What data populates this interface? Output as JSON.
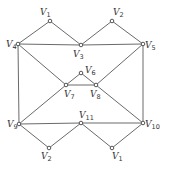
{
  "diagram": {
    "type": "graph",
    "width": 169,
    "height": 171,
    "colors": {
      "edge": "#6a6a6a",
      "node_stroke": "#555555",
      "node_fill": "#ffffff",
      "label": "#333333"
    },
    "nodes": [
      {
        "id": "n_v1_top",
        "letter": "V",
        "sub": "1",
        "x": 50,
        "y": 21,
        "lx": 40,
        "ly": 15
      },
      {
        "id": "n_v2_top",
        "letter": "V",
        "sub": "2",
        "x": 112,
        "y": 21,
        "lx": 113,
        "ly": 15
      },
      {
        "id": "n_v3",
        "letter": "V",
        "sub": "3",
        "x": 81,
        "y": 45,
        "lx": 73,
        "ly": 57
      },
      {
        "id": "n_v4",
        "letter": "V",
        "sub": "4",
        "x": 18,
        "y": 44,
        "lx": 6,
        "ly": 47
      },
      {
        "id": "n_v5",
        "letter": "V",
        "sub": "5",
        "x": 143,
        "y": 44,
        "lx": 145,
        "ly": 48
      },
      {
        "id": "n_v6",
        "letter": "V",
        "sub": "6",
        "x": 81,
        "y": 73,
        "lx": 85,
        "ly": 73
      },
      {
        "id": "n_v7",
        "letter": "V",
        "sub": "7",
        "x": 66,
        "y": 85,
        "lx": 64,
        "ly": 97
      },
      {
        "id": "n_v8",
        "letter": "V",
        "sub": "8",
        "x": 96,
        "y": 85,
        "lx": 90,
        "ly": 97
      },
      {
        "id": "n_v9",
        "letter": "V",
        "sub": "9",
        "x": 19,
        "y": 124,
        "lx": 7,
        "ly": 127
      },
      {
        "id": "n_v10",
        "letter": "V",
        "sub": "10",
        "x": 143,
        "y": 123,
        "lx": 145,
        "ly": 127
      },
      {
        "id": "n_v11",
        "letter": "V",
        "sub": "11",
        "x": 81,
        "y": 123,
        "lx": 79,
        "ly": 118
      },
      {
        "id": "n_v2_bot",
        "letter": "V",
        "sub": "2",
        "x": 49,
        "y": 148,
        "lx": 41,
        "ly": 159
      },
      {
        "id": "n_v1_bot",
        "letter": "V",
        "sub": "1",
        "x": 112,
        "y": 148,
        "lx": 112,
        "ly": 159
      }
    ],
    "edges": [
      [
        "n_v4",
        "n_v1_top"
      ],
      [
        "n_v1_top",
        "n_v3"
      ],
      [
        "n_v3",
        "n_v2_top"
      ],
      [
        "n_v2_top",
        "n_v5"
      ],
      [
        "n_v4",
        "n_v3"
      ],
      [
        "n_v3",
        "n_v5"
      ],
      [
        "n_v4",
        "n_v9"
      ],
      [
        "n_v5",
        "n_v10"
      ],
      [
        "n_v4",
        "n_v7"
      ],
      [
        "n_v5",
        "n_v8"
      ],
      [
        "n_v7",
        "n_v6"
      ],
      [
        "n_v6",
        "n_v8"
      ],
      [
        "n_v7",
        "n_v8"
      ],
      [
        "n_v7",
        "n_v9"
      ],
      [
        "n_v8",
        "n_v10"
      ],
      [
        "n_v9",
        "n_v11"
      ],
      [
        "n_v11",
        "n_v10"
      ],
      [
        "n_v9",
        "n_v2_bot"
      ],
      [
        "n_v2_bot",
        "n_v11"
      ],
      [
        "n_v11",
        "n_v1_bot"
      ],
      [
        "n_v1_bot",
        "n_v10"
      ]
    ]
  }
}
